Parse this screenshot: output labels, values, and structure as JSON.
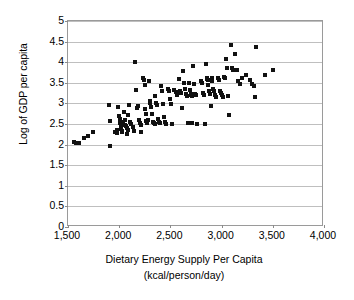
{
  "chart_data": {
    "type": "scatter",
    "title": "",
    "xlabel": "Dietary Energy Supply Per Capita",
    "xlabel_line2": "(kcal/person/day)",
    "ylabel": "Log of GDP per capita",
    "xlim": [
      1500,
      4000
    ],
    "ylim": [
      0,
      5
    ],
    "xticks": [
      1500,
      2000,
      2500,
      3000,
      3500,
      4000
    ],
    "xticklabels": [
      "1,500",
      "2,000",
      "2,500",
      "3,000",
      "3,500",
      "4,000"
    ],
    "yticks": [
      0,
      0.5,
      1,
      1.5,
      2,
      2.5,
      3,
      3.5,
      4,
      4.5,
      5
    ],
    "yticklabels": [
      "0",
      "0.5",
      "1",
      "1.5",
      "2",
      "2.5",
      "3",
      "3.5",
      "4",
      "4.5",
      "5"
    ],
    "grid": "horizontal",
    "legend": "none",
    "marker": "square",
    "marker_color": "#111111",
    "marker_size": 4,
    "series": [
      {
        "name": "countries",
        "points": [
          [
            1560,
            2.06
          ],
          [
            1580,
            2.04
          ],
          [
            1600,
            2.03
          ],
          [
            1610,
            2.05
          ],
          [
            1660,
            2.15
          ],
          [
            1700,
            2.2
          ],
          [
            1740,
            2.3
          ],
          [
            1900,
            2.95
          ],
          [
            1910,
            2.57
          ],
          [
            1915,
            1.96
          ],
          [
            1960,
            2.3
          ],
          [
            1975,
            2.35
          ],
          [
            1980,
            2.28
          ],
          [
            1990,
            2.92
          ],
          [
            2000,
            2.7
          ],
          [
            2005,
            2.52
          ],
          [
            2010,
            2.62
          ],
          [
            2015,
            2.44
          ],
          [
            2020,
            2.38
          ],
          [
            2025,
            2.33
          ],
          [
            2030,
            2.3
          ],
          [
            2035,
            2.55
          ],
          [
            2040,
            2.5
          ],
          [
            2050,
            2.78
          ],
          [
            2055,
            2.6
          ],
          [
            2060,
            2.47
          ],
          [
            2070,
            2.44
          ],
          [
            2075,
            2.26
          ],
          [
            2080,
            2.4
          ],
          [
            2085,
            2.36
          ],
          [
            2090,
            2.72
          ],
          [
            2100,
            2.95
          ],
          [
            2110,
            2.55
          ],
          [
            2120,
            2.5
          ],
          [
            2130,
            2.43
          ],
          [
            2140,
            2.32
          ],
          [
            2150,
            4.01
          ],
          [
            2160,
            3.32
          ],
          [
            2170,
            2.88
          ],
          [
            2180,
            2.93
          ],
          [
            2190,
            2.6
          ],
          [
            2200,
            2.52
          ],
          [
            2210,
            2.48
          ],
          [
            2215,
            2.3
          ],
          [
            2230,
            3.62
          ],
          [
            2240,
            3.58
          ],
          [
            2250,
            3.45
          ],
          [
            2255,
            2.86
          ],
          [
            2260,
            2.75
          ],
          [
            2265,
            2.58
          ],
          [
            2270,
            2.52
          ],
          [
            2280,
            2.6
          ],
          [
            2290,
            3.55
          ],
          [
            2300,
            3.05
          ],
          [
            2305,
            3.0
          ],
          [
            2310,
            2.92
          ],
          [
            2320,
            2.75
          ],
          [
            2330,
            2.55
          ],
          [
            2340,
            2.52
          ],
          [
            2345,
            2.5
          ],
          [
            2350,
            3.18
          ],
          [
            2360,
            3.0
          ],
          [
            2370,
            2.96
          ],
          [
            2380,
            2.62
          ],
          [
            2390,
            2.55
          ],
          [
            2400,
            2.52
          ],
          [
            2410,
            3.42
          ],
          [
            2420,
            3.3
          ],
          [
            2430,
            2.98
          ],
          [
            2440,
            2.66
          ],
          [
            2450,
            2.55
          ],
          [
            2460,
            2.5
          ],
          [
            2480,
            3.36
          ],
          [
            2490,
            3.3
          ],
          [
            2500,
            3.1
          ],
          [
            2510,
            2.98
          ],
          [
            2520,
            2.5
          ],
          [
            2540,
            3.32
          ],
          [
            2550,
            3.27
          ],
          [
            2560,
            3.2
          ],
          [
            2580,
            3.6
          ],
          [
            2590,
            3.3
          ],
          [
            2600,
            3.25
          ],
          [
            2610,
            2.88
          ],
          [
            2620,
            3.78
          ],
          [
            2630,
            3.5
          ],
          [
            2640,
            3.35
          ],
          [
            2650,
            3.22
          ],
          [
            2660,
            3.18
          ],
          [
            2670,
            2.52
          ],
          [
            2680,
            3.5
          ],
          [
            2690,
            3.32
          ],
          [
            2700,
            3.24
          ],
          [
            2705,
            3.2
          ],
          [
            2710,
            3.18
          ],
          [
            2715,
            2.52
          ],
          [
            2720,
            3.9
          ],
          [
            2730,
            3.46
          ],
          [
            2740,
            3.22
          ],
          [
            2750,
            3.2
          ],
          [
            2760,
            2.51
          ],
          [
            2800,
            3.55
          ],
          [
            2810,
            3.5
          ],
          [
            2820,
            3.25
          ],
          [
            2830,
            3.2
          ],
          [
            2840,
            2.51
          ],
          [
            2850,
            3.95
          ],
          [
            2855,
            3.62
          ],
          [
            2860,
            3.6
          ],
          [
            2865,
            3.58
          ],
          [
            2870,
            3.45
          ],
          [
            2880,
            3.3
          ],
          [
            2890,
            3.22
          ],
          [
            2900,
            2.93
          ],
          [
            2905,
            3.62
          ],
          [
            2910,
            3.55
          ],
          [
            2920,
            3.35
          ],
          [
            2930,
            3.3
          ],
          [
            2940,
            3.2
          ],
          [
            2950,
            3.15
          ],
          [
            2960,
            3.62
          ],
          [
            2970,
            3.58
          ],
          [
            2980,
            3.3
          ],
          [
            2990,
            3.25
          ],
          [
            3000,
            3.2
          ],
          [
            3010,
            3.16
          ],
          [
            3020,
            3.65
          ],
          [
            3030,
            3.62
          ],
          [
            3040,
            4.07
          ],
          [
            3050,
            3.85
          ],
          [
            3060,
            3.18
          ],
          [
            3070,
            2.71
          ],
          [
            3090,
            4.41
          ],
          [
            3100,
            3.86
          ],
          [
            3110,
            3.82
          ],
          [
            3130,
            4.2
          ],
          [
            3150,
            3.81
          ],
          [
            3160,
            3.55
          ],
          [
            3180,
            3.48
          ],
          [
            3200,
            3.62
          ],
          [
            3240,
            3.7
          ],
          [
            3280,
            3.58
          ],
          [
            3300,
            3.48
          ],
          [
            3320,
            3.43
          ],
          [
            3330,
            3.15
          ],
          [
            3340,
            4.36
          ],
          [
            3420,
            3.7
          ],
          [
            3500,
            3.81
          ]
        ]
      }
    ]
  }
}
